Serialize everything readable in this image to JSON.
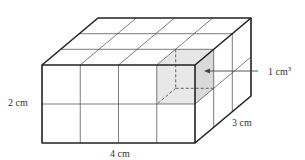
{
  "diagram": {
    "type": "rectangular-prism-unit-cubes",
    "dimensions": {
      "length_units": 4,
      "height_units": 2,
      "depth_units": 3
    },
    "labels": {
      "length": "4 cm",
      "height": "2 cm",
      "depth": "3 cm",
      "unit_cube": "1 cm",
      "unit_cube_exponent": "3"
    },
    "colors": {
      "edge": "#222222",
      "shaded_cube_front": "#e6e6e6",
      "shaded_cube_side": "#d9d9d9",
      "background": "#ffffff"
    }
  }
}
